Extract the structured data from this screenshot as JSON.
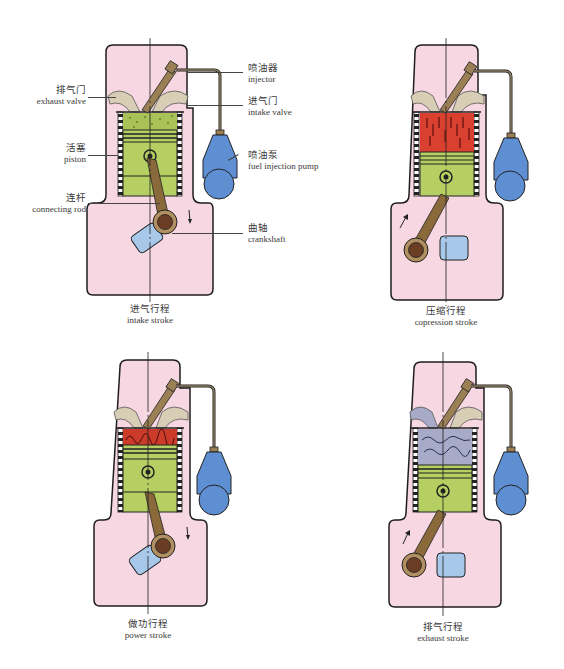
{
  "colors": {
    "block": "#f6d7e2",
    "outline": "#1e1e1e",
    "piston": "#b6cf63",
    "intake_charge": "#a9c257",
    "compressed_air": "#d9402f",
    "combustion": "#cc3a2a",
    "exhaust_gas": "#a7abc8",
    "rod": "#8a6a3a",
    "crank_pin": "#6b3d25",
    "counterweight": "#a8c8ea",
    "pump": "#5f8fd3",
    "ports": "#d8cdb5"
  },
  "labels": {
    "exhaust_valve": {
      "zh": "排气门",
      "en": "exhaust valve"
    },
    "piston": {
      "zh": "活塞",
      "en": "piston"
    },
    "connecting_rod": {
      "zh": "连杆",
      "en": "connecting rod"
    },
    "injector": {
      "zh": "喷油器",
      "en": "injector"
    },
    "intake_valve": {
      "zh": "进气门",
      "en": "intake valve"
    },
    "fuel_injection_pump": {
      "zh": "喷油泵",
      "en": "fuel injection pump"
    },
    "crankshaft": {
      "zh": "曲轴",
      "en": "crankshaft"
    }
  },
  "strokes": [
    {
      "id": "intake",
      "zh": "进气行程",
      "en": "intake stroke",
      "chamber": "intake_charge",
      "rod_direction": "down"
    },
    {
      "id": "compression",
      "zh": "压缩行程",
      "en": "copression stroke",
      "chamber": "compressed_air",
      "rod_direction": "up"
    },
    {
      "id": "power",
      "zh": "做功行程",
      "en": "power stroke",
      "chamber": "combustion",
      "rod_direction": "down"
    },
    {
      "id": "exhaust",
      "zh": "排气行程",
      "en": "exhaust stroke",
      "chamber": "exhaust_gas",
      "rod_direction": "up"
    }
  ]
}
